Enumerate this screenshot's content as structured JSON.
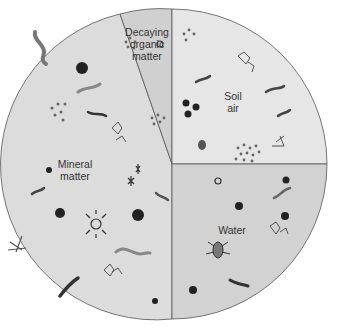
{
  "diagram": {
    "center": [
      172,
      164
    ],
    "radius": 155,
    "sectors": [
      {
        "id": "mineral",
        "label": "Mineral\nmatter",
        "fill": "#dcdcdc",
        "label_pos": [
          74,
          162
        ]
      },
      {
        "id": "organic",
        "label": "Decaying\norganic\nmatter",
        "fill": "#d0d0d0",
        "label_pos": [
          147,
          40
        ]
      },
      {
        "id": "air",
        "label": "Soil\nair",
        "fill": "#e6e6e6",
        "label_pos": [
          233,
          100
        ]
      },
      {
        "id": "water",
        "label": "Water",
        "fill": "#d2d2d2",
        "label_pos": [
          232,
          226
        ]
      }
    ],
    "outline_color": "#555555"
  }
}
